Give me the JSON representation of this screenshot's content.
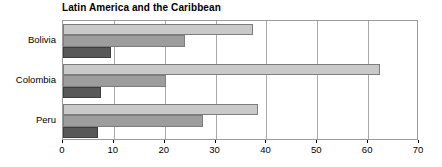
{
  "chart_data": {
    "type": "bar",
    "orientation": "horizontal",
    "title": "Latin America and the Caribbean",
    "xlabel": "",
    "ylabel": "",
    "categories": [
      "Bolivia",
      "Colombia",
      "Peru"
    ],
    "series": [
      {
        "name": "series-1",
        "color": "#c9c9c9",
        "values": [
          37.4,
          62.3,
          38.3
        ]
      },
      {
        "name": "series-2",
        "color": "#9d9d9d",
        "values": [
          24.0,
          20.3,
          27.5
        ]
      },
      {
        "name": "series-3",
        "color": "#585858",
        "values": [
          9.4,
          7.5,
          6.9
        ]
      }
    ],
    "xlim": [
      0,
      70
    ],
    "xticks": [
      0,
      10,
      20,
      30,
      40,
      50,
      60,
      70
    ],
    "xtick_labels": [
      "0",
      "10",
      "20",
      "30",
      "40",
      "50",
      "60",
      "70"
    ],
    "grid": true,
    "grid_axis": "x",
    "legend": false
  },
  "colors": {
    "frame": "#9a9a9a",
    "gridline": "#a8a8a8",
    "bar_border": "#7d7d7d",
    "text": "#000000",
    "background": "#ffffff"
  }
}
